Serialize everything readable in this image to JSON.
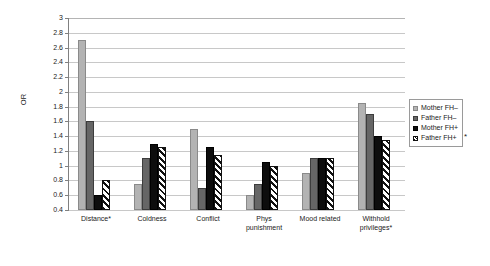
{
  "chart_data": {
    "type": "bar",
    "title": "",
    "xlabel": "",
    "ylabel": "OR",
    "ylim": [
      0.4,
      3
    ],
    "ytick_step": 0.2,
    "grid": true,
    "legend_position": "right",
    "categories": [
      "Distance*",
      "Coldness",
      "Conflict",
      "Phys\npunishment",
      "Mood related",
      "Withhold\nprivileges*"
    ],
    "yticks": [
      "3",
      "2.8",
      "2.6",
      "2.4",
      "2.2",
      "2",
      "1.8",
      "1.6",
      "1.4",
      "1.2",
      "1",
      "0.8",
      "0.6",
      "0.4"
    ],
    "series": [
      {
        "name": "Mother FH–",
        "values": [
          2.7,
          0.75,
          1.5,
          0.6,
          0.9,
          1.85
        ]
      },
      {
        "name": "Father FH–",
        "values": [
          1.6,
          1.1,
          0.7,
          0.75,
          1.1,
          1.7
        ]
      },
      {
        "name": "Mother FH+",
        "values": [
          0.6,
          1.3,
          1.25,
          1.05,
          1.1,
          1.4
        ]
      },
      {
        "name": "Father FH+",
        "values": [
          0.8,
          1.25,
          1.15,
          1.0,
          1.1,
          1.35
        ]
      }
    ],
    "annotations": [
      {
        "name": "floating-asterisk",
        "text": "*"
      }
    ]
  },
  "legend": {
    "items": [
      {
        "label": "Mother FH–"
      },
      {
        "label": "Father FH–"
      },
      {
        "label": "Mother FH+"
      },
      {
        "label": "Father FH+"
      }
    ]
  },
  "colors": {
    "series0": "#b3b3b3",
    "series1": "#666666",
    "series2": "#0d0d0d",
    "series3": "#111111",
    "gridline": "#c8c8c8",
    "axis": "#808080",
    "background": "#ffffff"
  }
}
